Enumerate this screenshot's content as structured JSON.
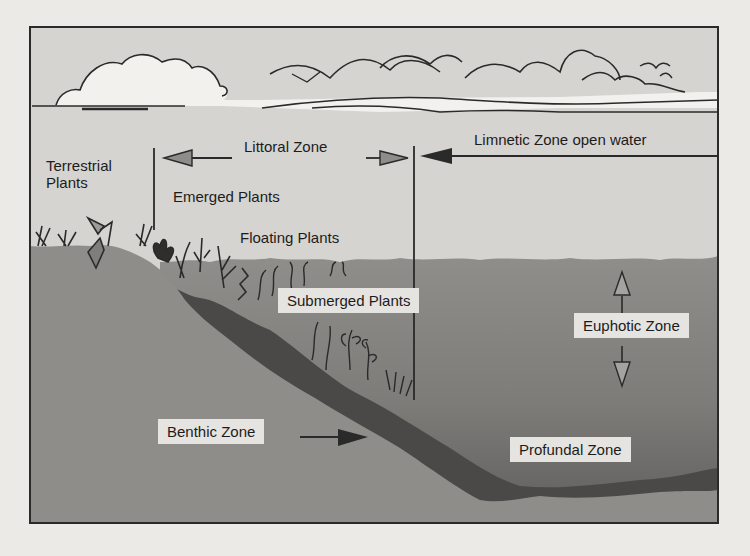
{
  "figure": {
    "colors": {
      "sky": "#d6d4d0",
      "cloud": "#f2f1ee",
      "water_upper": "#8c8b88",
      "water_deep": "#6a6967",
      "land": "#8e8d8a",
      "sediment": "#4a4948",
      "label_box": "#e6e4e0",
      "line": "#2a2a2a"
    },
    "labels": {
      "terrestrial_plants_line1": "Terrestrial",
      "terrestrial_plants_line2": "Plants",
      "littoral_zone": "Littoral Zone",
      "limnetic_zone": "Limnetic Zone open water",
      "emerged_plants": "Emerged Plants",
      "floating_plants": "Floating Plants",
      "submerged_plants": "Submerged Plants",
      "euphotic_zone": "Euphotic Zone",
      "benthic_zone": "Benthic Zone",
      "profundal_zone": "Profundal Zone"
    },
    "arrows": {
      "littoral": "left and right arrows spanning littoral zone",
      "limnetic": "left-pointing arrow from right edge",
      "euphotic": "up and down arrows",
      "benthic": "right-pointing arrow to lake bottom"
    }
  }
}
